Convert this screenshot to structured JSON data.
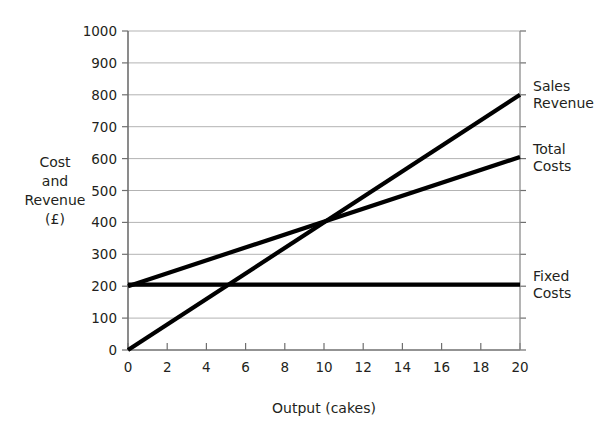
{
  "chart_data": {
    "type": "line",
    "title": "",
    "xlabel": "Output (cakes)",
    "ylabel": "Cost and Revenue (£)",
    "ylabel_lines": [
      "Cost",
      "and",
      "Revenue",
      "(£)"
    ],
    "xlim": [
      0,
      20
    ],
    "ylim": [
      0,
      1000
    ],
    "x_ticks": [
      0,
      2,
      4,
      6,
      8,
      10,
      12,
      14,
      16,
      18,
      20
    ],
    "x_tick_labels": [
      "0",
      "2",
      "4",
      "6",
      "8",
      "10",
      "12",
      "14",
      "16",
      "18",
      "20"
    ],
    "y_ticks": [
      0,
      100,
      200,
      300,
      400,
      500,
      600,
      700,
      800,
      900,
      1000
    ],
    "y_tick_labels": [
      "0",
      "100",
      "200",
      "300",
      "400",
      "500",
      "600",
      "700",
      "800",
      "900",
      "1000"
    ],
    "grid": true,
    "grid_axis": "y",
    "legend": "right-of-plot-inline-labels",
    "line_color": "#000000",
    "grid_color": "#b3b3b3",
    "axis_color": "#6f6f6f",
    "background": "#ffffff",
    "series": [
      {
        "name": "Sales Revenue",
        "label_lines": [
          "Sales",
          "Revenue"
        ],
        "x": [
          0,
          20
        ],
        "values": [
          0,
          800
        ],
        "slope_per_cake": 40
      },
      {
        "name": "Total Costs",
        "label_lines": [
          "Total",
          "Costs"
        ],
        "x": [
          0,
          20
        ],
        "values": [
          200,
          605
        ],
        "slope_per_cake": 20.25
      },
      {
        "name": "Fixed Costs",
        "label_lines": [
          "Fixed",
          "Costs"
        ],
        "x": [
          0,
          20
        ],
        "values": [
          205,
          205
        ],
        "slope_per_cake": 0
      }
    ],
    "annotations": [
      {
        "name": "break-even-point",
        "x": 10,
        "y": 400,
        "text": ""
      }
    ]
  }
}
